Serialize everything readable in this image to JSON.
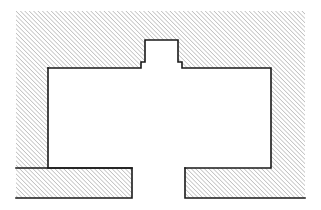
{
  "figure": {
    "kind": "technical-cross-section",
    "title": "",
    "background_color": "#ffffff",
    "canvas": {
      "width": 321,
      "height": 210
    }
  },
  "style": {
    "hatch_line_color": "#6e6e6e",
    "hatch_fill_color": "#ffffff",
    "hatch_angle_deg": 45,
    "hatch_spacing_px": 2.2,
    "hatch_line_width_px": 0.7,
    "outline_color": "#1a1a1a",
    "outline_width_px": 1.6,
    "cavity_fill_color": "#ffffff"
  },
  "regions": [
    {
      "name": "sectioned-body",
      "label": "Hatched section body",
      "fill": "hatch",
      "outline_visible_on": [
        "cavity-edges",
        "lower-block-edges"
      ],
      "bounds": {
        "x": 16,
        "y": 11,
        "width": 289,
        "height": 187
      }
    },
    {
      "name": "cavity",
      "label": "Central cavity",
      "fill": "#ffffff",
      "bounds": {
        "x": 48,
        "y": 68,
        "width": 223,
        "height": 100
      }
    },
    {
      "name": "top-notch",
      "label": "Top sprue notch",
      "fill": "#ffffff",
      "bounds": {
        "x": 145,
        "y": 40,
        "width": 33,
        "height": 28
      }
    },
    {
      "name": "left-bottom-gap",
      "label": "Left lower relief gap",
      "fill": "#ffffff",
      "bounds": {
        "x": 132,
        "y": 168,
        "width": 53,
        "height": 30
      }
    }
  ],
  "outline_paths": {
    "cavity_with_notch": "M 48 68 L 141 68 L 141 62 L 145 62 L 145 40 L 178 40 L 178 62 L 182 62 L 182 68 L 271 68 L 271 168 L 185 168 L 185 198 L 182 198 L 182 168 L 135 168 L 135 198 L 132 198 L 132 168 Z",
    "notch_left_shoulder_x": 141,
    "notch_right_shoulder_x": 182,
    "notch_shoulder_y": 62,
    "notch_top_y": 40,
    "cavity_top_y": 68,
    "cavity_bottom_y": 168,
    "cavity_left_x": 48,
    "cavity_right_x": 271
  },
  "blocks": [
    {
      "name": "lower-left-block",
      "label": "Lower left hatched block",
      "bounds": {
        "x": 16,
        "y": 168,
        "width": 116,
        "height": 30
      }
    },
    {
      "name": "lower-right-block",
      "label": "Lower right hatched block",
      "bounds": {
        "x": 185,
        "y": 168,
        "width": 120,
        "height": 30
      }
    }
  ],
  "annotations": [],
  "dimensions": []
}
